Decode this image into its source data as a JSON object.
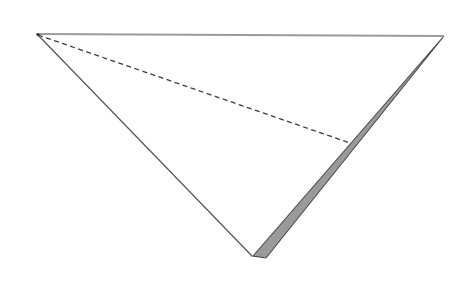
{
  "figure": {
    "background_color": "#ffffff",
    "canvas": {
      "width": 449,
      "height": 283
    },
    "colors": {
      "top_edge_stroke": "#9a9a9a",
      "left_edge_stroke": "#555555",
      "band_fill": "#9a9a9a",
      "band_stroke": "#4a4a4a",
      "fold_dash_stroke": "#3c3c3c",
      "interior_fill": "#ffffff"
    },
    "vertices": {
      "apex_left": {
        "x": 37,
        "y": 34,
        "label": "top-left apex"
      },
      "apex_right": {
        "x": 444,
        "y": 36,
        "label": "top-right apex"
      },
      "bottom": {
        "x": 252,
        "y": 256,
        "label": "bottom vertex"
      },
      "band_bottom_outer": {
        "x": 266,
        "y": 258,
        "label": "band bottom tip"
      },
      "fold_end": {
        "x": 350,
        "y": 143,
        "label": "crease endpoint on right edge"
      }
    },
    "elements": [
      {
        "name": "top-edge",
        "kind": "line",
        "stroke": "#9a9a9a",
        "stroke_width": 2.1,
        "dashed": false,
        "points": "37,34 444,36"
      },
      {
        "name": "left-edge",
        "kind": "line",
        "stroke": "#555555",
        "stroke_width": 1.2,
        "dashed": false,
        "points": "37,34 252,256"
      },
      {
        "name": "right-band",
        "kind": "polygon",
        "fill": "#9a9a9a",
        "stroke": "#4a4a4a",
        "stroke_width": 1.1,
        "points": "444,36 266,258 253,256"
      },
      {
        "name": "fold-crease",
        "kind": "line",
        "stroke": "#3c3c3c",
        "stroke_width": 1.3,
        "dashed": true,
        "dash_pattern": "5 3.5",
        "points": "38,35 350,143"
      }
    ],
    "geometry_notes": {
      "shape": "downward-pointing triangle with a narrow shaded fold band along the right edge",
      "dash_segment_length_px": 5,
      "dash_gap_length_px": 3.5,
      "band_max_width_px": 11
    }
  }
}
